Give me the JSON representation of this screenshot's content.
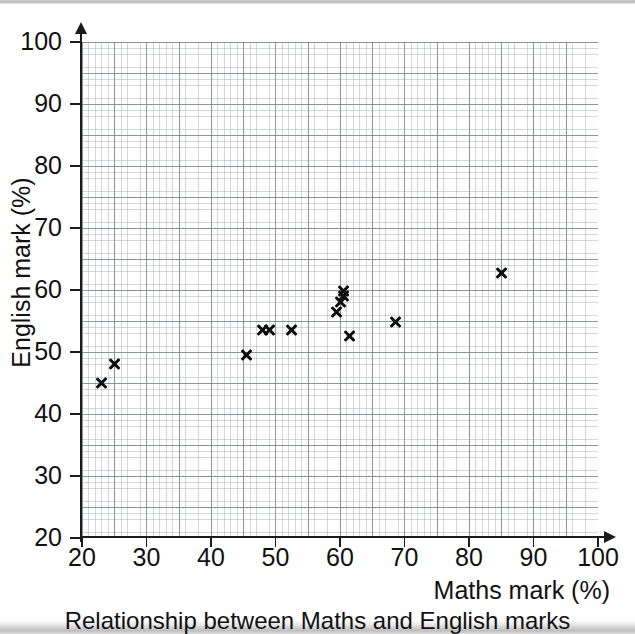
{
  "chart_data": {
    "type": "scatter",
    "title": "Relationship between Maths and English marks",
    "xlabel": "Maths mark (%)",
    "ylabel": "English mark (%)",
    "xlim": [
      20,
      100
    ],
    "ylim": [
      20,
      100
    ],
    "xticks": [
      20,
      30,
      40,
      50,
      60,
      70,
      80,
      90,
      100
    ],
    "yticks": [
      20,
      30,
      40,
      50,
      60,
      70,
      80,
      90,
      100
    ],
    "grid": "graph-paper, minor 1 unit, major 5 units",
    "legend": "none",
    "marker": "x",
    "marker_color": "#0d0d0d",
    "points": [
      {
        "maths": 23,
        "english": 45
      },
      {
        "maths": 25,
        "english": 48
      },
      {
        "maths": 45.5,
        "english": 49.5
      },
      {
        "maths": 48,
        "english": 53.5
      },
      {
        "maths": 49,
        "english": 53.5
      },
      {
        "maths": 52.5,
        "english": 53.5
      },
      {
        "maths": 59.5,
        "english": 56.5
      },
      {
        "maths": 60,
        "english": 58
      },
      {
        "maths": 60.5,
        "english": 59
      },
      {
        "maths": 60.5,
        "english": 59.8
      },
      {
        "maths": 61.5,
        "english": 52.5
      },
      {
        "maths": 68.5,
        "english": 54.8
      },
      {
        "maths": 85,
        "english": 62.7
      }
    ]
  },
  "axes": {
    "x_tick_labels": [
      "20",
      "30",
      "40",
      "50",
      "60",
      "70",
      "80",
      "90",
      "100"
    ],
    "y_tick_labels": [
      "20",
      "30",
      "40",
      "50",
      "60",
      "70",
      "80",
      "90",
      "100"
    ]
  }
}
